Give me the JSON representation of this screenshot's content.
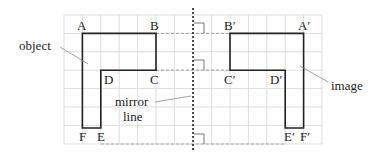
{
  "diagram": {
    "grid": {
      "x0": 64,
      "y0": 15,
      "cols": 14,
      "rows": 7,
      "step": 18.4,
      "color": "#cfcfcf"
    },
    "mirror_line_x": 193,
    "object_points": {
      "A": "A",
      "B": "B",
      "C": "C",
      "D": "D",
      "E": "E",
      "F": "F"
    },
    "image_points": {
      "A": "A′",
      "B": "B′",
      "C": "C′",
      "D": "D′",
      "E": "E′",
      "F": "F′"
    },
    "labels": {
      "object": "object",
      "image": "image",
      "mirror_line_1": "mirror",
      "mirror_line_2": "line"
    },
    "colors": {
      "shape": "#222222",
      "dashed": "#9a9a9a",
      "leader": "#8a8a8a"
    }
  }
}
